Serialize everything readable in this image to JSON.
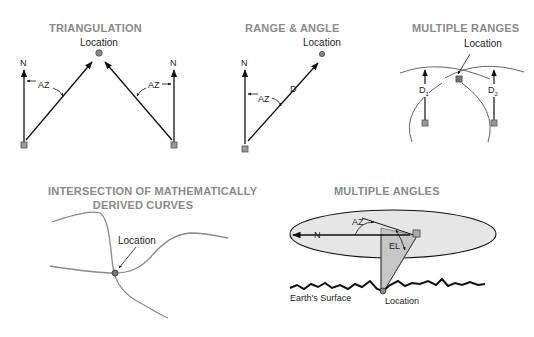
{
  "panels": {
    "triangulation": {
      "title": "TRIANGULATION",
      "location": "Location",
      "north_left": "N",
      "north_right": "N",
      "az_left": "AZ",
      "az_right": "AZ"
    },
    "range_angle": {
      "title": "RANGE & ANGLE",
      "location": "Location",
      "north": "N",
      "az": "AZ",
      "distance": "D"
    },
    "multiple_ranges": {
      "title": "MULTIPLE RANGES",
      "location": "Location",
      "d1": "D",
      "d1_sub": "1",
      "d2": "D",
      "d2_sub": "2"
    },
    "intersection": {
      "title_line1": "INTERSECTION OF MATHEMATICALLY",
      "title_line2": "DERIVED CURVES",
      "location": "Location"
    },
    "multiple_angles": {
      "title": "MULTIPLE ANGLES",
      "north": "N",
      "az": "AZ",
      "el": "EL",
      "surface": "Earth's Surface",
      "location": "Location"
    }
  },
  "colors": {
    "title": "#8a8a8a",
    "line": "#111111",
    "marker_fill": "#999999",
    "ellipse_fill": "#e6e6e6",
    "triangle_fill": "#c8c8c8",
    "curve": "#888888"
  }
}
